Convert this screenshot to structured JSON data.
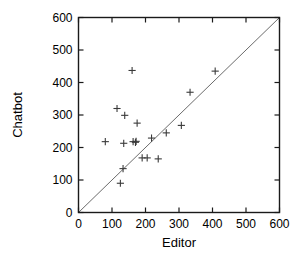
{
  "chart_data": {
    "type": "scatter",
    "title": "",
    "xlabel": "Editor",
    "ylabel": "Chatbot",
    "xlim": [
      0,
      600
    ],
    "ylim": [
      0,
      600
    ],
    "xticks": [
      0,
      100,
      200,
      300,
      400,
      500,
      600
    ],
    "yticks": [
      0,
      100,
      200,
      300,
      400,
      500,
      600
    ],
    "xticklabels": [
      "0",
      "100",
      "200",
      "300",
      "400",
      "500",
      "600"
    ],
    "yticklabels": [
      "0",
      "100",
      "200",
      "300",
      "400",
      "500",
      "600"
    ],
    "grid": false,
    "legend": null,
    "marker": "plus",
    "marker_color": "#3a3a3a",
    "reference_line": {
      "description": "y = x identity line",
      "from": [
        0,
        0
      ],
      "to": [
        600,
        600
      ],
      "color": "#5a5a5a"
    },
    "points": [
      {
        "x": 80,
        "y": 218
      },
      {
        "x": 115,
        "y": 320
      },
      {
        "x": 125,
        "y": 90
      },
      {
        "x": 133,
        "y": 135
      },
      {
        "x": 135,
        "y": 213
      },
      {
        "x": 138,
        "y": 299
      },
      {
        "x": 160,
        "y": 437
      },
      {
        "x": 163,
        "y": 218
      },
      {
        "x": 170,
        "y": 216
      },
      {
        "x": 172,
        "y": 219
      },
      {
        "x": 175,
        "y": 275
      },
      {
        "x": 190,
        "y": 168
      },
      {
        "x": 205,
        "y": 168
      },
      {
        "x": 218,
        "y": 229
      },
      {
        "x": 238,
        "y": 165
      },
      {
        "x": 262,
        "y": 245
      },
      {
        "x": 307,
        "y": 268
      },
      {
        "x": 333,
        "y": 370
      },
      {
        "x": 408,
        "y": 435
      }
    ]
  },
  "axes": {
    "x_title": "Editor",
    "y_title": "Chatbot"
  }
}
